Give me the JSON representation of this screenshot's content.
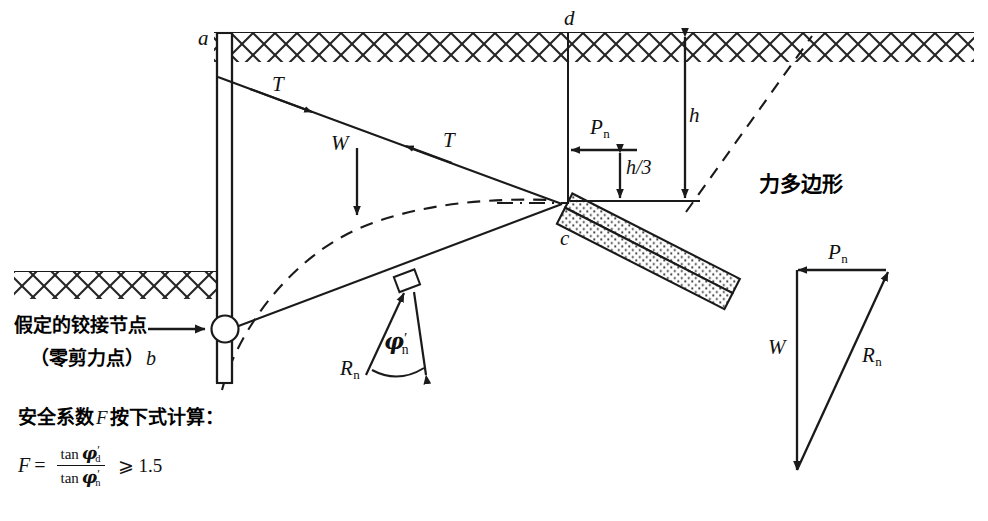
{
  "figure": {
    "title_cjk": "力多边形",
    "type": "geotechnical-anchored-sheet-pile-free-earth-support-diagram"
  },
  "labels": {
    "point_a": "a",
    "point_b": "b",
    "point_c": "c",
    "point_d": "d",
    "tie_upper": "T",
    "tie_lower": "T",
    "weight": "W",
    "height": "h",
    "third_height": "h/3",
    "pressure": "P",
    "pressure_sub": "n",
    "reaction": "R",
    "reaction_sub": "n",
    "phi_symbol": "φ",
    "phi_sub": "n",
    "phi_prime": "′",
    "force_polygon_cjk": "力多边形"
  },
  "annotations": {
    "hinge_line1_cjk": "假定的铰接节点",
    "hinge_line2_cjk": "（零剪力点）",
    "hinge_point_letter": "b",
    "safety_note_cjk": "安全系数",
    "safety_note_symbol": "F",
    "safety_note_cjk2": "按下式计算：",
    "formula_lhs": "F",
    "formula_equals": "=",
    "formula_num_fn": "tan",
    "formula_num_var": "φ",
    "formula_num_sub": "d",
    "formula_den_fn": "tan",
    "formula_den_var": "φ",
    "formula_den_sub": "n",
    "formula_prime": "′",
    "formula_relation": "⩾",
    "formula_value": "1.5"
  },
  "force_polygon": {
    "vectors": [
      {
        "name": "P",
        "sub": "n",
        "direction": "left",
        "label": "Pn"
      },
      {
        "name": "W",
        "sub": "",
        "direction": "down",
        "label": "W"
      },
      {
        "name": "R",
        "sub": "n",
        "direction": "up-right",
        "label": "Rn"
      }
    ]
  },
  "colors": {
    "line": "#1a1a1a",
    "background": "#ffffff",
    "hatch": "#222222",
    "stipple": "#333333"
  }
}
